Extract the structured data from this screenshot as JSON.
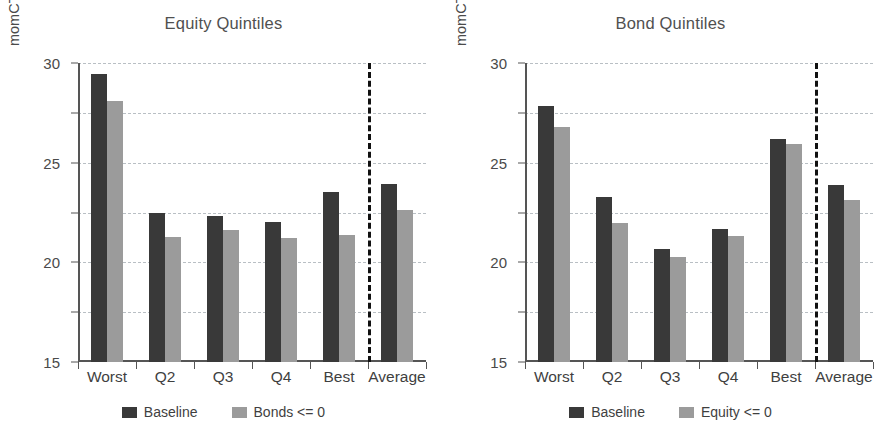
{
  "chart_data": [
    {
      "type": "bar",
      "title": "Equity Quintiles",
      "xlabel": "",
      "ylabel": "momCTA Annualized returns (%)",
      "categories": [
        "Worst",
        "Q2",
        "Q3",
        "Q4",
        "Best",
        "Average"
      ],
      "series": [
        {
          "name": "Baseline",
          "color": "#393939",
          "values": [
            28.9,
            15.0,
            14.7,
            14.0,
            17.1,
            17.9
          ]
        },
        {
          "name": "Bonds <= 0",
          "color": "#9b9b9b",
          "values": [
            26.2,
            12.5,
            13.2,
            12.4,
            12.7,
            15.3
          ]
        }
      ],
      "ylim": [
        0,
        30
      ],
      "yticks": [
        0,
        5,
        10,
        15,
        20,
        25,
        30
      ],
      "ytick_labels": [
        "0",
        "5",
        "10",
        "15",
        "20",
        "25",
        "30"
      ],
      "grid": true,
      "legend_position": "bottom",
      "annotations": [
        {
          "name": "average-separator",
          "type": "vertical-dashed-line",
          "after_category": "Best"
        }
      ]
    },
    {
      "type": "bar",
      "title": "Bond Quintiles",
      "xlabel": "",
      "ylabel": "momCTA Annualized returns (%)",
      "categories": [
        "Worst",
        "Q2",
        "Q3",
        "Q4",
        "Best",
        "Average"
      ],
      "series": [
        {
          "name": "Baseline",
          "color": "#393939",
          "values": [
            25.7,
            16.6,
            11.3,
            13.3,
            22.4,
            17.8
          ]
        },
        {
          "name": "Equity <= 0",
          "color": "#9b9b9b",
          "values": [
            23.6,
            13.9,
            10.5,
            12.6,
            21.9,
            16.3
          ]
        }
      ],
      "ylim": [
        0,
        30
      ],
      "yticks": [
        0,
        5,
        10,
        15,
        20,
        25,
        30
      ],
      "ytick_labels": [
        "0",
        "5",
        "10",
        "15",
        "20",
        "25",
        "30"
      ],
      "grid": true,
      "legend_position": "bottom",
      "annotations": [
        {
          "name": "average-separator",
          "type": "vertical-dashed-line",
          "after_category": "Best"
        }
      ]
    }
  ]
}
